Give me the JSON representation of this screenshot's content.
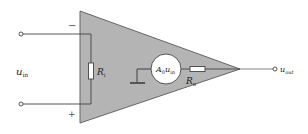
{
  "diagram": {
    "input_label": "u",
    "input_sub": "in",
    "output_label": "u",
    "output_sub": "out",
    "minus_sign": "−",
    "plus_sign": "+",
    "ri_label": "R",
    "ri_sub": "i",
    "ro_label": "R",
    "ro_sub": "o",
    "source_label": "A",
    "source_sub0": "0",
    "source_u": "u",
    "source_sub_in": "in",
    "colors": {
      "triangle_fill": "#b4b4b4",
      "triangle_stroke": "#555555",
      "wire": "#444444",
      "background": "#ffffff"
    }
  }
}
